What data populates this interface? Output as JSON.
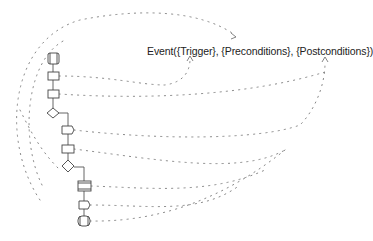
{
  "diagram": {
    "event_label": "Event({Trigger}, {Preconditions}, {Postconditions})",
    "colors": {
      "background": "#ffffff",
      "text": "#222222",
      "shape_stroke": "#444444",
      "dotted_link": "#7a7a7a"
    },
    "nodes": [
      {
        "id": "start",
        "type": "terminator"
      },
      {
        "id": "step-1",
        "type": "process"
      },
      {
        "id": "step-2",
        "type": "process"
      },
      {
        "id": "decision-1",
        "type": "decision"
      },
      {
        "id": "step-3",
        "type": "process"
      },
      {
        "id": "step-4",
        "type": "process"
      },
      {
        "id": "decision-2",
        "type": "decision"
      },
      {
        "id": "subprocess",
        "type": "predefined-process"
      },
      {
        "id": "step-5",
        "type": "process"
      },
      {
        "id": "end",
        "type": "terminator"
      }
    ],
    "link_targets": [
      "Trigger",
      "Preconditions",
      "Postconditions"
    ]
  }
}
